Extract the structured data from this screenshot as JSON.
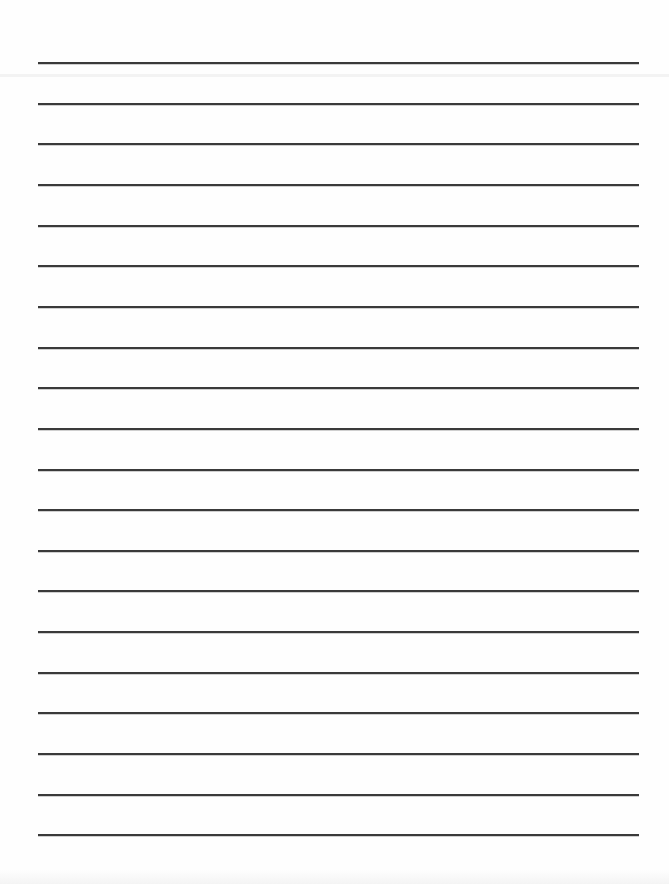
{
  "document": {
    "type": "lined-paper",
    "background_color": "#fefefe",
    "rule_color": "#3a3a3a",
    "rule_count": 20,
    "rule_left": 38,
    "rule_right": 639,
    "first_rule_y": 62,
    "rule_spacing": 40.65,
    "rule_thickness": 2,
    "faint_band_y": 74
  }
}
